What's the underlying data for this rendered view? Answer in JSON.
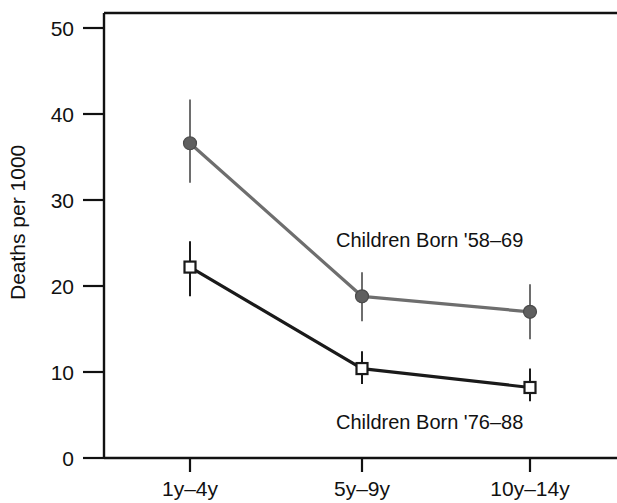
{
  "chart_data": {
    "type": "line",
    "title": "",
    "subtitle": "",
    "xlabel": "",
    "ylabel": "Deaths per 1000",
    "categories": [
      "1y–4y",
      "5y–9y",
      "10y–14y"
    ],
    "ylim": [
      0,
      50
    ],
    "y_ticks": [
      0,
      10,
      20,
      30,
      40,
      50
    ],
    "y_tick_labels": [
      "0",
      "10",
      "20",
      "30",
      "40",
      "50"
    ],
    "grid": false,
    "legend_position": "inline-annotations",
    "series": [
      {
        "name": "Children Born '58–69",
        "marker": "filled-circle",
        "color": "#6e6e6e",
        "values": [
          36.6,
          18.8,
          17.0
        ],
        "err_low": [
          32.0,
          15.9,
          13.8
        ],
        "err_high": [
          41.7,
          21.6,
          20.2
        ]
      },
      {
        "name": "Children Born '76–88",
        "marker": "open-square",
        "color": "#1a1a1a",
        "values": [
          22.2,
          10.4,
          8.2
        ],
        "err_low": [
          18.8,
          8.6,
          6.6
        ],
        "err_high": [
          25.2,
          12.4,
          10.4
        ]
      }
    ],
    "annotations": [
      {
        "text": "Children Born '58–69",
        "x_px": 336,
        "y_px": 247
      },
      {
        "text": "Children Born '76–88",
        "x_px": 336,
        "y_px": 429
      }
    ]
  },
  "axes": {
    "y_title": "Deaths per 1000",
    "y_tick_0": "0",
    "y_tick_10": "10",
    "y_tick_20": "20",
    "y_tick_30": "30",
    "y_tick_40": "40",
    "y_tick_50": "50",
    "x_tick_1": "1y–4y",
    "x_tick_2": "5y–9y",
    "x_tick_3": "10y–14y"
  },
  "annotations": {
    "upper_series_label": "Children Born '58–69",
    "lower_series_label": "Children Born '76–88"
  }
}
